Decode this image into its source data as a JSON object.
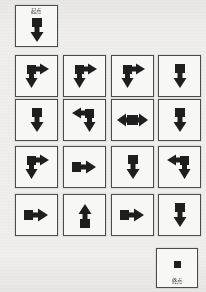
{
  "page": {
    "background_color": "#f2f1ee",
    "ink_color": "#1b1b1b",
    "cell_border_color": "#4a4a48",
    "cell_fill_color": "#fbfbfa"
  },
  "labels": {
    "start": "起点",
    "end": "终点"
  },
  "start_cell": {
    "label": "起点",
    "icon": "arrow-down-icon",
    "direction": "down",
    "x": 15,
    "y": 5,
    "w": 43,
    "h": 42
  },
  "end_cell": {
    "label": "终点",
    "icon": "square-block-icon",
    "direction": "none",
    "x": 156,
    "y": 248,
    "w": 42,
    "h": 40
  },
  "grid": {
    "rows": 4,
    "cols": 4,
    "cell_w": 43,
    "cell_h": 42,
    "col_x": [
      15,
      63,
      111,
      158
    ],
    "row_y": [
      55,
      99,
      146,
      194
    ],
    "cells": [
      {
        "row": 1,
        "col": 1,
        "icon": "arrow-down-right-icon",
        "directions": [
          "down",
          "right"
        ]
      },
      {
        "row": 1,
        "col": 2,
        "icon": "arrow-down-right-icon",
        "directions": [
          "down",
          "right"
        ]
      },
      {
        "row": 1,
        "col": 3,
        "icon": "arrow-down-right-icon",
        "directions": [
          "down",
          "right"
        ]
      },
      {
        "row": 1,
        "col": 4,
        "icon": "arrow-down-icon",
        "directions": [
          "down"
        ]
      },
      {
        "row": 2,
        "col": 1,
        "icon": "arrow-down-icon",
        "directions": [
          "down"
        ]
      },
      {
        "row": 2,
        "col": 2,
        "icon": "arrow-left-down-icon",
        "directions": [
          "left",
          "down"
        ]
      },
      {
        "row": 2,
        "col": 3,
        "icon": "arrow-left-right-icon",
        "directions": [
          "left",
          "right"
        ]
      },
      {
        "row": 2,
        "col": 4,
        "icon": "arrow-down-icon",
        "directions": [
          "down"
        ]
      },
      {
        "row": 3,
        "col": 1,
        "icon": "arrow-down-right-icon",
        "directions": [
          "down",
          "right"
        ]
      },
      {
        "row": 3,
        "col": 2,
        "icon": "arrow-right-icon",
        "directions": [
          "right"
        ]
      },
      {
        "row": 3,
        "col": 3,
        "icon": "arrow-down-icon",
        "directions": [
          "down"
        ]
      },
      {
        "row": 3,
        "col": 4,
        "icon": "arrow-left-down-icon",
        "directions": [
          "left",
          "down"
        ]
      },
      {
        "row": 4,
        "col": 1,
        "icon": "arrow-right-icon",
        "directions": [
          "right"
        ]
      },
      {
        "row": 4,
        "col": 2,
        "icon": "arrow-up-icon",
        "directions": [
          "up"
        ]
      },
      {
        "row": 4,
        "col": 3,
        "icon": "arrow-right-icon",
        "directions": [
          "right"
        ]
      },
      {
        "row": 4,
        "col": 4,
        "icon": "arrow-down-icon",
        "directions": [
          "down"
        ]
      }
    ]
  }
}
